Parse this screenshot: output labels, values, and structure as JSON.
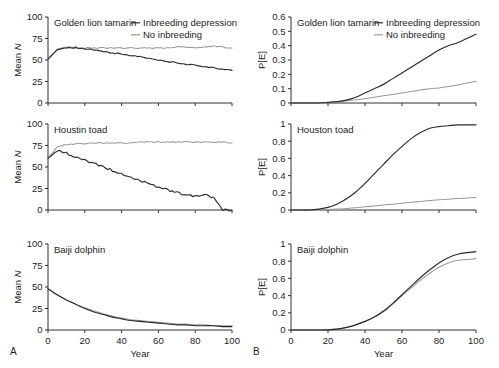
{
  "figure": {
    "panel_letters": {
      "left": "A",
      "right": "B"
    },
    "legend": {
      "series_dark": "Inbreeding depression",
      "series_light": "No inbreeding"
    },
    "axis_titles": {
      "x": "Year",
      "y_left": "Mean N",
      "y_right": "P[E]"
    }
  },
  "chart_data": [
    {
      "type": "line",
      "panel": "A-top",
      "title": "Golden lion tamarin",
      "xlabel": "Year",
      "ylabel": "Mean N",
      "xlim": [
        0,
        100
      ],
      "ylim": [
        0,
        100
      ],
      "xticks": [
        0,
        20,
        40,
        60,
        80,
        100
      ],
      "yticks": [
        0,
        25,
        50,
        75,
        100
      ],
      "grid": false,
      "legend_position": "top-right",
      "x": [
        0,
        5,
        10,
        15,
        20,
        25,
        30,
        35,
        40,
        45,
        50,
        55,
        60,
        65,
        70,
        75,
        80,
        85,
        90,
        95,
        100
      ],
      "series": [
        {
          "name": "Inbreeding depression",
          "color": "#2a2a2a",
          "values": [
            51,
            62,
            64,
            64,
            63,
            62,
            60,
            58,
            57,
            55,
            54,
            52,
            50,
            48,
            47,
            45,
            44,
            42,
            41,
            39,
            38
          ]
        },
        {
          "name": "No inbreeding",
          "color": "#9a9a9a",
          "values": [
            51,
            62,
            65,
            65,
            64,
            64,
            64,
            64,
            64,
            64,
            64,
            64,
            64,
            64,
            65,
            65,
            64,
            65,
            66,
            65,
            64
          ]
        }
      ]
    },
    {
      "type": "line",
      "panel": "A-middle",
      "title": "Houstin toad",
      "xlabel": "Year",
      "ylabel": "Mean N",
      "xlim": [
        0,
        100
      ],
      "ylim": [
        0,
        100
      ],
      "xticks": [
        0,
        20,
        40,
        60,
        80,
        100
      ],
      "yticks": [
        0,
        25,
        50,
        75,
        100
      ],
      "grid": false,
      "x": [
        0,
        5,
        10,
        15,
        20,
        25,
        30,
        35,
        40,
        45,
        50,
        55,
        60,
        65,
        70,
        75,
        80,
        85,
        90,
        95,
        100
      ],
      "series": [
        {
          "name": "Inbreeding depression",
          "color": "#2a2a2a",
          "values": [
            60,
            69,
            66,
            62,
            58,
            54,
            50,
            46,
            42,
            38,
            34,
            30,
            27,
            23,
            20,
            18,
            16,
            18,
            14,
            0,
            0
          ]
        },
        {
          "name": "No inbreeding",
          "color": "#9a9a9a",
          "values": [
            60,
            73,
            76,
            77,
            77,
            78,
            78,
            78,
            78,
            78,
            79,
            79,
            79,
            79,
            79,
            79,
            79,
            79,
            79,
            79,
            78
          ]
        }
      ]
    },
    {
      "type": "line",
      "panel": "A-bottom",
      "title": "Baiji dolphin",
      "xlabel": "Year",
      "ylabel": "Mean N",
      "xlim": [
        0,
        100
      ],
      "ylim": [
        0,
        100
      ],
      "xticks": [
        0,
        20,
        40,
        60,
        80,
        100
      ],
      "yticks": [
        0,
        25,
        50,
        75,
        100
      ],
      "grid": false,
      "x": [
        0,
        5,
        10,
        15,
        20,
        25,
        30,
        35,
        40,
        45,
        50,
        55,
        60,
        65,
        70,
        75,
        80,
        85,
        90,
        95,
        100
      ],
      "series": [
        {
          "name": "Inbreeding depression",
          "color": "#2a2a2a",
          "values": [
            48,
            41,
            35,
            30,
            25,
            21,
            18,
            15,
            13,
            11,
            10,
            9,
            8,
            7,
            6,
            6,
            5,
            5,
            5,
            4,
            4
          ]
        },
        {
          "name": "No inbreeding",
          "color": "#9a9a9a",
          "values": [
            48,
            41,
            35,
            30,
            26,
            22,
            19,
            16,
            14,
            12,
            11,
            10,
            9,
            8,
            7,
            7,
            6,
            6,
            5,
            5,
            5
          ]
        }
      ]
    },
    {
      "type": "line",
      "panel": "B-top",
      "title": "Golden lion tamarin",
      "xlabel": "Year",
      "ylabel": "P[E]",
      "xlim": [
        0,
        100
      ],
      "ylim": [
        0,
        0.6
      ],
      "xticks": [
        0,
        20,
        40,
        60,
        80,
        100
      ],
      "yticks": [
        0,
        0.1,
        0.2,
        0.3,
        0.4,
        0.5,
        0.6
      ],
      "grid": false,
      "legend_position": "top-right",
      "x": [
        0,
        5,
        10,
        15,
        20,
        25,
        30,
        35,
        40,
        45,
        50,
        55,
        60,
        65,
        70,
        75,
        80,
        85,
        90,
        95,
        100
      ],
      "series": [
        {
          "name": "Inbreeding depression",
          "color": "#2a2a2a",
          "values": [
            0,
            0,
            0,
            0,
            0.005,
            0.01,
            0.02,
            0.04,
            0.07,
            0.1,
            0.13,
            0.17,
            0.21,
            0.25,
            0.29,
            0.33,
            0.37,
            0.4,
            0.42,
            0.45,
            0.48
          ]
        },
        {
          "name": "No inbreeding",
          "color": "#9a9a9a",
          "values": [
            0,
            0,
            0,
            0,
            0.003,
            0.008,
            0.015,
            0.022,
            0.03,
            0.04,
            0.05,
            0.06,
            0.07,
            0.08,
            0.09,
            0.1,
            0.105,
            0.115,
            0.125,
            0.14,
            0.15
          ]
        }
      ]
    },
    {
      "type": "line",
      "panel": "B-middle",
      "title": "Houston toad",
      "xlabel": "Year",
      "ylabel": "P[E]",
      "xlim": [
        0,
        100
      ],
      "ylim": [
        0,
        1
      ],
      "xticks": [
        0,
        20,
        40,
        60,
        80,
        100
      ],
      "yticks": [
        0,
        0.2,
        0.4,
        0.6,
        0.8,
        1
      ],
      "grid": false,
      "x": [
        0,
        5,
        10,
        15,
        20,
        25,
        30,
        35,
        40,
        45,
        50,
        55,
        60,
        65,
        70,
        75,
        80,
        85,
        90,
        95,
        100
      ],
      "series": [
        {
          "name": "Inbreeding depression",
          "color": "#2a2a2a",
          "values": [
            0,
            0,
            0,
            0.01,
            0.03,
            0.07,
            0.13,
            0.21,
            0.31,
            0.42,
            0.53,
            0.64,
            0.74,
            0.83,
            0.9,
            0.95,
            0.97,
            0.98,
            0.99,
            0.99,
            0.99
          ]
        },
        {
          "name": "No inbreeding",
          "color": "#9a9a9a",
          "values": [
            0,
            0,
            0,
            0.002,
            0.005,
            0.01,
            0.018,
            0.027,
            0.037,
            0.047,
            0.058,
            0.068,
            0.079,
            0.089,
            0.1,
            0.11,
            0.12,
            0.125,
            0.133,
            0.14,
            0.145
          ]
        }
      ]
    },
    {
      "type": "line",
      "panel": "B-bottom",
      "title": "Baiji dolphin",
      "xlabel": "Year",
      "ylabel": "P[E]",
      "xlim": [
        0,
        100
      ],
      "ylim": [
        0,
        1
      ],
      "xticks": [
        0,
        20,
        40,
        60,
        80,
        100
      ],
      "yticks": [
        0,
        0.2,
        0.4,
        0.6,
        0.8,
        1
      ],
      "grid": false,
      "x": [
        0,
        5,
        10,
        15,
        20,
        25,
        30,
        35,
        40,
        45,
        50,
        55,
        60,
        65,
        70,
        75,
        80,
        85,
        90,
        95,
        100
      ],
      "series": [
        {
          "name": "Inbreeding depression",
          "color": "#2a2a2a",
          "values": [
            0,
            0,
            0,
            0,
            0.002,
            0.01,
            0.03,
            0.06,
            0.1,
            0.15,
            0.22,
            0.31,
            0.41,
            0.51,
            0.61,
            0.7,
            0.78,
            0.84,
            0.88,
            0.9,
            0.91
          ]
        },
        {
          "name": "No inbreeding",
          "color": "#9a9a9a",
          "values": [
            0,
            0,
            0,
            0,
            0.002,
            0.01,
            0.03,
            0.06,
            0.1,
            0.15,
            0.21,
            0.3,
            0.4,
            0.49,
            0.58,
            0.66,
            0.73,
            0.78,
            0.81,
            0.82,
            0.83
          ]
        }
      ]
    }
  ]
}
